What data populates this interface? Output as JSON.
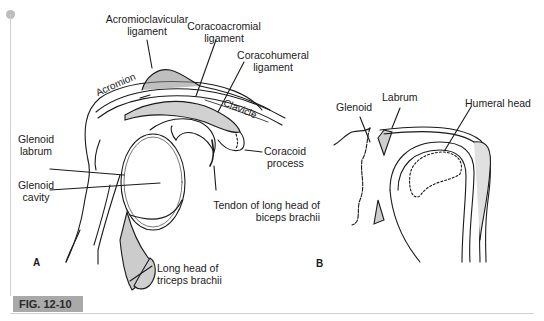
{
  "figure": {
    "tag": "FIG. 12-10",
    "colors": {
      "tag_bg": "#a9a9a9",
      "line": "#1a1a1a",
      "shade": "#cfcfcf",
      "rule": "#cfcfcf"
    },
    "panel_a": {
      "letter": "A",
      "labels": {
        "acromioclavicular": [
          "Acromioclavicular",
          "ligament"
        ],
        "coracoacromial": [
          "Coracoacromial",
          "ligament"
        ],
        "coracohumeral": [
          "Coracohumeral",
          "ligament"
        ],
        "acromion": "Acromion",
        "clavicle": "Clavicle",
        "glenoid_labrum": [
          "Glenoid",
          "labrum"
        ],
        "coracoid_process": [
          "Coracoid",
          "process"
        ],
        "glenoid_cavity": [
          "Glenoid",
          "cavity"
        ],
        "biceps_tendon": [
          "Tendon of long head of",
          "biceps brachii"
        ],
        "triceps": [
          "Long head of",
          "triceps brachii"
        ]
      }
    },
    "panel_b": {
      "letter": "B",
      "labels": {
        "glenoid": "Glenoid",
        "labrum": "Labrum",
        "humeral_head": "Humeral head"
      }
    }
  }
}
